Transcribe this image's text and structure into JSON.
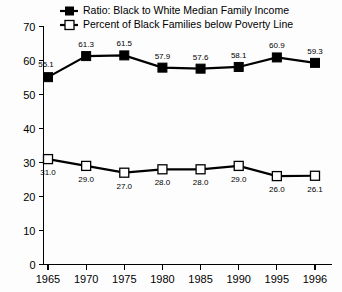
{
  "chart_data": {
    "type": "line",
    "title": "",
    "xlabel": "",
    "ylabel": "",
    "categories": [
      "1965",
      "1970",
      "1975",
      "1980",
      "1985",
      "1990",
      "1995",
      "1996"
    ],
    "ylim": [
      0,
      70
    ],
    "yticks": [
      "0",
      "10",
      "20",
      "30",
      "40",
      "50",
      "60",
      "70"
    ],
    "ytick_values": [
      0,
      10,
      20,
      30,
      40,
      50,
      60,
      70
    ],
    "grid": false,
    "legend_position": "top-center",
    "series": [
      {
        "name": "Ratio: Black to White Median Family Income",
        "marker": "filled-square",
        "color": "#000000",
        "label_position": "above",
        "values": [
          55.1,
          61.3,
          61.5,
          57.9,
          57.6,
          58.1,
          60.9,
          59.3
        ],
        "labels": [
          "55.1",
          "61.3",
          "61.5",
          "57.9",
          "57.6",
          "58.1",
          "60.9",
          "59.3"
        ]
      },
      {
        "name": "Percent of Black Families below Poverty Line",
        "marker": "open-square",
        "color": "#000000",
        "label_position": "below",
        "values": [
          31.0,
          29.0,
          27.0,
          28.0,
          28.0,
          29.0,
          26.0,
          26.1
        ],
        "labels": [
          "31.0",
          "29.0",
          "27.0",
          "28.0",
          "28.0",
          "29.0",
          "26.0",
          "26.1"
        ]
      }
    ]
  },
  "legend": {
    "items": [
      {
        "label": "Ratio: Black to White Median Family Income",
        "marker": "filled-square-icon"
      },
      {
        "label": "Percent of Black Families below Poverty Line",
        "marker": "open-square-icon"
      }
    ]
  }
}
